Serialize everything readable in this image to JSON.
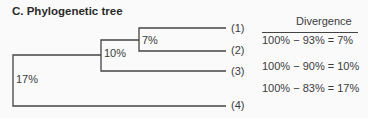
{
  "title": "C. Phylogenetic tree",
  "tree": {
    "nodes": [
      {
        "label": "17%",
        "joins": [
          "node-10%",
          "(4)"
        ]
      },
      {
        "label": "10%",
        "joins": [
          "node-7%",
          "(3)"
        ]
      },
      {
        "label": "7%",
        "joins": [
          "(1)",
          "(2)"
        ]
      }
    ],
    "leaves": [
      "(1)",
      "(2)",
      "(3)",
      "(4)"
    ]
  },
  "divergence": {
    "header": "Divergence",
    "equations": [
      "100% − 93% = 7%",
      "100% − 90% = 10%",
      "100% − 83% = 17%"
    ]
  },
  "colors": {
    "line": "#444444",
    "text": "#3a3a3a",
    "background": "#fafafa"
  }
}
